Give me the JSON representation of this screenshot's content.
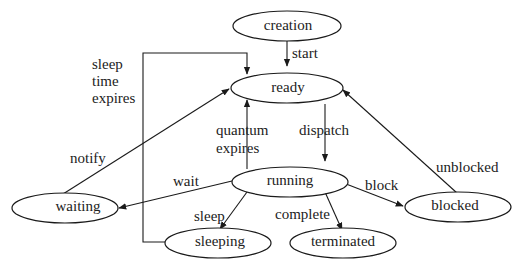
{
  "diagram": {
    "type": "state-transition",
    "title": "",
    "nodes": [
      {
        "id": "creation",
        "label": "creation"
      },
      {
        "id": "ready",
        "label": "ready"
      },
      {
        "id": "running",
        "label": "running"
      },
      {
        "id": "waiting",
        "label": "waiting"
      },
      {
        "id": "sleeping",
        "label": "sleeping"
      },
      {
        "id": "terminated",
        "label": "terminated"
      },
      {
        "id": "blocked",
        "label": "blocked"
      }
    ],
    "edges": [
      {
        "from": "creation",
        "to": "ready",
        "label": "start"
      },
      {
        "from": "ready",
        "to": "running",
        "label": "dispatch"
      },
      {
        "from": "running",
        "to": "ready",
        "label_lines": [
          "quantum",
          "expires"
        ]
      },
      {
        "from": "running",
        "to": "waiting",
        "label": "wait"
      },
      {
        "from": "waiting",
        "to": "ready",
        "label": "notify"
      },
      {
        "from": "running",
        "to": "sleeping",
        "label": "sleep"
      },
      {
        "from": "sleeping",
        "to": "ready",
        "label_lines": [
          "sleep",
          "time",
          "expires"
        ]
      },
      {
        "from": "running",
        "to": "terminated",
        "label": "complete"
      },
      {
        "from": "running",
        "to": "blocked",
        "label": "block"
      },
      {
        "from": "blocked",
        "to": "ready",
        "label": "unblocked"
      }
    ]
  }
}
